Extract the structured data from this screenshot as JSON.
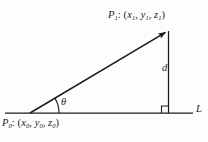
{
  "figure": {
    "type": "geometry-diagram",
    "background_color": "#fdfdfd",
    "stroke_color": "#1c1c1c",
    "labels": {
      "point_upper": {
        "name": "P",
        "subscript": "1",
        "separator": ":",
        "coordinates_open": "(",
        "coord_x": "x",
        "coord_x_sub": "1",
        "coord_y": "y",
        "coord_y_sub": "1",
        "coord_z": "z",
        "coord_z_sub": "1",
        "comma": ",",
        "coordinates_close": ")"
      },
      "point_lower": {
        "name": "P",
        "subscript": "0",
        "separator": ":",
        "coordinates_open": "(",
        "coord_x": "x",
        "coord_x_sub": "0",
        "coord_y": "y",
        "coord_y_sub": "0",
        "coord_z": "z",
        "coord_z_sub": "0",
        "comma": ",",
        "coordinates_close": ")"
      },
      "distance": "d",
      "angle": "θ",
      "line": "L"
    },
    "geometry": {
      "vertex_x": 30,
      "vertex_y": 113,
      "apex_x": 168,
      "apex_y": 30,
      "baseline_start_x": 5,
      "baseline_end_x": 193,
      "baseline_y": 113,
      "right_angle_size": 7
    }
  }
}
